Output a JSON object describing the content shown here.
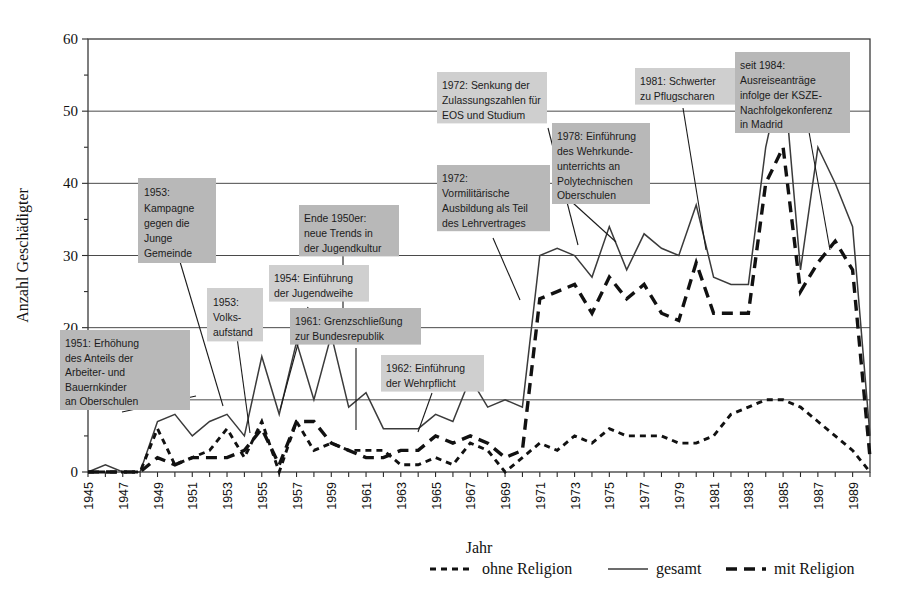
{
  "chart_data": {
    "type": "line",
    "title": "",
    "xlabel": "Jahr",
    "ylabel": "Anzahl Geschädigter",
    "xlim": [
      1945,
      1990
    ],
    "ylim": [
      0,
      60
    ],
    "yticks": [
      0,
      10,
      20,
      30,
      40,
      50,
      60
    ],
    "yminor_step": 5,
    "grid": "horizontal",
    "legend_position": "bottom",
    "x": [
      1945,
      1946,
      1947,
      1948,
      1949,
      1950,
      1951,
      1952,
      1953,
      1954,
      1955,
      1956,
      1957,
      1958,
      1959,
      1960,
      1961,
      1962,
      1963,
      1964,
      1965,
      1966,
      1967,
      1968,
      1969,
      1970,
      1971,
      1972,
      1973,
      1974,
      1975,
      1976,
      1977,
      1978,
      1979,
      1980,
      1981,
      1982,
      1983,
      1984,
      1985,
      1986,
      1987,
      1988,
      1989,
      1990
    ],
    "xtick_labels": [
      "1945",
      "1947",
      "1949",
      "1951",
      "1953",
      "1955",
      "1957",
      "1959",
      "1961",
      "1963",
      "1965",
      "1967",
      "1969",
      "1971",
      "1973",
      "1975",
      "1977",
      "1979",
      "1981",
      "1983",
      "1985",
      "1987",
      "1989"
    ],
    "series": [
      {
        "name": "gesamt",
        "style": "solid-thin",
        "values": [
          0,
          1,
          0,
          0,
          7,
          8,
          5,
          7,
          8,
          5,
          16,
          8,
          18,
          10,
          19,
          9,
          11,
          6,
          6,
          6,
          8,
          7,
          13,
          9,
          10,
          9,
          30,
          31,
          30,
          27,
          34,
          28,
          33,
          31,
          30,
          37,
          27,
          26,
          26,
          45,
          56,
          28,
          45,
          40,
          34,
          5
        ]
      },
      {
        "name": "mit Religion",
        "style": "long-dash",
        "values": [
          0,
          0,
          0,
          0,
          2,
          1,
          2,
          2,
          2,
          3,
          6,
          1,
          7,
          7,
          4,
          3,
          2,
          2,
          3,
          3,
          5,
          4,
          5,
          4,
          2,
          3,
          24,
          25,
          26,
          22,
          27,
          24,
          26,
          22,
          21,
          29,
          22,
          22,
          22,
          40,
          45,
          25,
          29,
          32,
          28,
          2
        ]
      },
      {
        "name": "ohne Religion",
        "style": "short-dash",
        "values": [
          0,
          0,
          0,
          0,
          6,
          1,
          2,
          3,
          6,
          2,
          7,
          0,
          7,
          3,
          4,
          3,
          3,
          3,
          1,
          1,
          2,
          1,
          4,
          3,
          0,
          2,
          4,
          3,
          5,
          4,
          6,
          5,
          5,
          5,
          4,
          4,
          5,
          8,
          9,
          10,
          10,
          9,
          7,
          5,
          3,
          0
        ]
      }
    ],
    "annotations": [
      {
        "id": "a1951",
        "text": "1951: Erhöhung des Anteils der Arbeiter- und Bauernkinder an Oberschulen",
        "lines": [
          "1951: Erhöhung",
          "des Anteils der",
          "Arbeiter- und",
          "Bauernkinder",
          "an Oberschulen"
        ]
      },
      {
        "id": "a1953k",
        "text": "1953: Kampagne gegen die Junge Gemeinde",
        "lines": [
          "1953:",
          "Kampagne",
          "gegen die",
          "Junge",
          "Gemeinde"
        ]
      },
      {
        "id": "a1953v",
        "text": "1953: Volks-aufstand",
        "lines": [
          "1953:",
          "Volks-",
          "aufstand"
        ]
      },
      {
        "id": "a1954",
        "text": "1954: Einführung der Jugendweihe",
        "lines": [
          "1954: Einführung",
          "der Jugendweihe"
        ]
      },
      {
        "id": "a1950er",
        "text": "Ende 1950er: neue Trends in der Jugendkultur",
        "lines": [
          "Ende 1950er:",
          "neue Trends in",
          "der Jugendkultur"
        ]
      },
      {
        "id": "a1961",
        "text": "1961: Grenzschließung zur Bundesrepublik",
        "lines": [
          "1961: Grenzschließung",
          "zur Bundesrepublik"
        ]
      },
      {
        "id": "a1962",
        "text": "1962: Einführung der Wehrpflicht",
        "lines": [
          "1962: Einführung",
          "der Wehrpflicht"
        ]
      },
      {
        "id": "a1972v",
        "text": "1972: Vormilitärische Ausbildung als Teil des Lehrvertrages",
        "lines": [
          "1972:",
          "Vormilitärische",
          "Ausbildung als Teil",
          "des Lehrvertrages"
        ]
      },
      {
        "id": "a1972s",
        "text": "1972: Senkung der Zulassungszahlen für EOS und Studium",
        "lines": [
          "1972: Senkung der",
          "Zulassungszahlen für",
          "EOS und Studium"
        ]
      },
      {
        "id": "a1978",
        "text": "1978: Einführung des Wehrkundeunterrichts an Polytechnischen Oberschulen",
        "lines": [
          "1978: Einführung",
          "des Wehrkunde-",
          "unterrichts an",
          "Polytechnischen",
          "Oberschulen"
        ]
      },
      {
        "id": "a1981",
        "text": "1981: Schwerter zu Pflugscharen",
        "lines": [
          "1981: Schwerter",
          "zu Pflugscharen"
        ]
      },
      {
        "id": "a1984",
        "text": "seit 1984: Ausreiseanträge infolge der KSZE-Nachfolgekonferenz in Madrid",
        "lines": [
          "seit 1984:",
          "Ausreiseanträge",
          "infolge der KSZE-",
          "Nachfolgekonferenz",
          "in Madrid"
        ]
      }
    ],
    "legend": [
      {
        "label": "ohne Religion",
        "style": "short-dash"
      },
      {
        "label": "gesamt",
        "style": "solid-thin"
      },
      {
        "label": "mit Religion",
        "style": "long-dash"
      }
    ],
    "colors": {
      "series_line": "#111111",
      "gesamt_line": "#3b3b3b",
      "annotation_box": "#b8b8b8",
      "annotation_box_light": "#cfcfcf",
      "frame": "#3a3a3a",
      "background": "#ffffff"
    }
  }
}
